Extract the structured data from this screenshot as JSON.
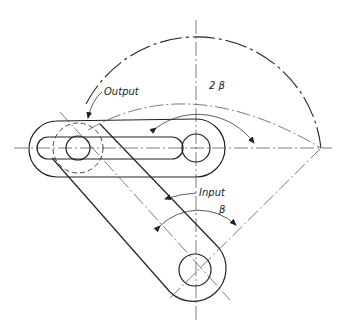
{
  "diagram": {
    "type": "mechanism-sketch",
    "labels": {
      "output": "Output",
      "input": "Input",
      "output_angle": "2 β",
      "input_angle": "β"
    },
    "stroke_color": "#222222",
    "background": "#ffffff"
  }
}
